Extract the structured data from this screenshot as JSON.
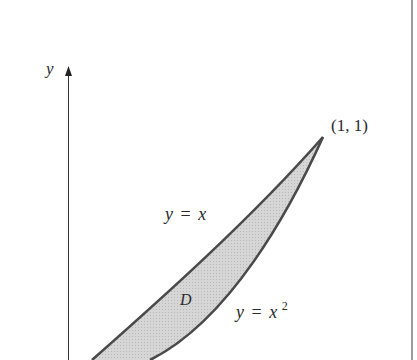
{
  "diagram": {
    "axis": {
      "y_label": "y"
    },
    "point": {
      "label": "(1, 1)"
    },
    "curves": {
      "upper": {
        "label_lhs": "y",
        "label_eq": "=",
        "label_rhs": "x"
      },
      "lower": {
        "label_lhs": "y",
        "label_eq": "=",
        "label_rhs": "x",
        "label_exp": "2"
      }
    },
    "region": {
      "label": "D",
      "fill": "#cfcfcf"
    },
    "colors": {
      "stroke": "#4a4a4a",
      "axis": "#333333",
      "border": "#777777"
    }
  }
}
